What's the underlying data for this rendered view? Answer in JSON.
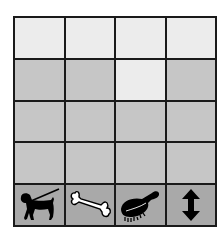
{
  "board": {
    "rows": 5,
    "cols": 4,
    "colors": {
      "light": "#ececec",
      "shaded": "#c6c6c6",
      "icon_row": "#a9a9a9",
      "grid_line": "#1a1a1a"
    },
    "grid": [
      [
        "light",
        "light",
        "light",
        "light"
      ],
      [
        "shaded",
        "shaded",
        "light",
        "shaded"
      ],
      [
        "shaded",
        "shaded",
        "shaded",
        "shaded"
      ],
      [
        "shaded",
        "shaded",
        "shaded",
        "shaded"
      ],
      [
        "icon",
        "icon",
        "icon",
        "icon"
      ]
    ],
    "icons": [
      {
        "name": "dog-on-leash-icon",
        "label": "Walk the dog"
      },
      {
        "name": "bone-icon",
        "label": "Feed / treat"
      },
      {
        "name": "brush-icon",
        "label": "Groom"
      },
      {
        "name": "up-down-arrow-icon",
        "label": "Move up/down"
      }
    ]
  }
}
